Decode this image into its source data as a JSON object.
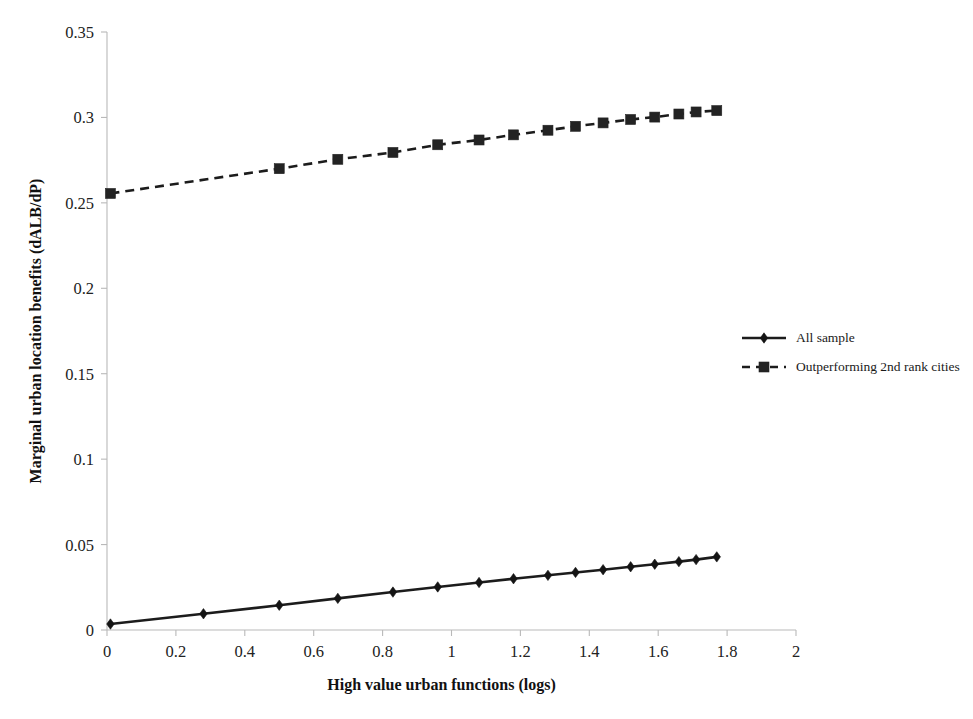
{
  "chart_data": {
    "type": "line",
    "title": "",
    "xlabel": "High value urban functions (logs)",
    "ylabel": "Marginal urban location benefits (dALB/dP)",
    "xlim": [
      0,
      2
    ],
    "ylim": [
      0,
      0.35
    ],
    "xticks": [
      0,
      0.2,
      0.4,
      0.6,
      0.8,
      1,
      1.2,
      1.4,
      1.6,
      1.8,
      2
    ],
    "xtick_labels": [
      "0",
      "0.2",
      "0.4",
      "0.6",
      "0.8",
      "1",
      "1.2",
      "1.4",
      "1.6",
      "1.8",
      "2"
    ],
    "yticks": [
      0,
      0.05,
      0.1,
      0.15,
      0.2,
      0.25,
      0.3,
      0.35
    ],
    "ytick_labels": [
      "0",
      "0.05",
      "0.1",
      "0.15",
      "0.2",
      "0.25",
      "0.3",
      "0.35"
    ],
    "grid": false,
    "legend_position": "right",
    "series": [
      {
        "name": "All sample",
        "line_style": "solid",
        "marker": "diamond",
        "color": "#1c1c1c",
        "x": [
          0.01,
          0.28,
          0.5,
          0.67,
          0.83,
          0.96,
          1.08,
          1.18,
          1.28,
          1.36,
          1.44,
          1.52,
          1.59,
          1.66,
          1.71,
          1.77
        ],
        "y": [
          0.0035,
          0.0095,
          0.0145,
          0.0185,
          0.0222,
          0.0252,
          0.0278,
          0.03,
          0.032,
          0.0337,
          0.0353,
          0.037,
          0.0385,
          0.04,
          0.0412,
          0.0428
        ]
      },
      {
        "name": "Outperforming 2nd rank cities",
        "line_style": "dashed",
        "marker": "square",
        "color": "#232323",
        "x": [
          0.01,
          0.5,
          0.67,
          0.83,
          0.96,
          1.08,
          1.18,
          1.28,
          1.36,
          1.44,
          1.52,
          1.59,
          1.66,
          1.71,
          1.77
        ],
        "y": [
          0.2555,
          0.27,
          0.2755,
          0.2795,
          0.284,
          0.2868,
          0.2898,
          0.2925,
          0.2948,
          0.2968,
          0.2988,
          0.3002,
          0.302,
          0.3032,
          0.304
        ]
      }
    ]
  },
  "legend": {
    "items": [
      {
        "label": "All sample",
        "style": "solid",
        "marker": "diamond"
      },
      {
        "label": "Outperforming 2nd rank cities",
        "style": "dashed",
        "marker": "square"
      }
    ]
  },
  "colors": {
    "series_ink": "#1c1c1c",
    "axis": "#b9b9b9",
    "text": "#1a1a1a",
    "background": "#ffffff"
  }
}
